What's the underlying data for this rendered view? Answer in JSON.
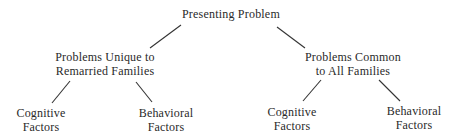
{
  "diagram": {
    "type": "tree",
    "root": {
      "label": "Presenting Problem",
      "children": [
        {
          "label_lines": [
            "Problems Unique to",
            "Remarried Families"
          ],
          "children": [
            {
              "label_lines": [
                "Cognitive",
                "Factors"
              ]
            },
            {
              "label_lines": [
                "Behavioral",
                "Factors"
              ]
            }
          ]
        },
        {
          "label_lines": [
            "Problems Common",
            "to All Families"
          ],
          "children": [
            {
              "label_lines": [
                "Cognitive",
                "Factors"
              ]
            },
            {
              "label_lines": [
                "Behavioral",
                "Factors"
              ]
            }
          ]
        }
      ]
    },
    "line_color": "#333333",
    "text_color": "#2a2a2a"
  }
}
